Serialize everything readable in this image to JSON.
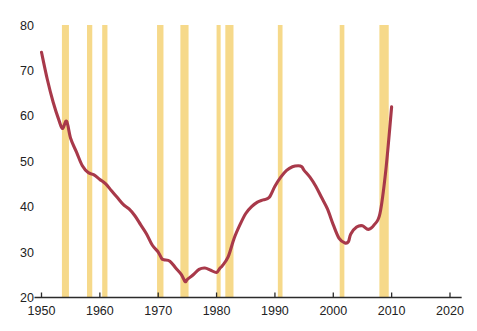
{
  "chart_data": {
    "type": "line",
    "title": "",
    "subtitle": "",
    "xlabel": "",
    "ylabel": "",
    "xlim": [
      1948,
      2022
    ],
    "ylim": [
      20,
      80
    ],
    "grid": false,
    "legend": "none",
    "y_ticks": [
      20,
      30,
      40,
      50,
      60,
      70,
      80
    ],
    "x_ticks": [
      1950,
      1960,
      1970,
      1980,
      1990,
      2000,
      2010,
      2020
    ],
    "series": [
      {
        "name": "series-1",
        "color": "#a8394a",
        "x": [
          1950,
          1951,
          1952,
          1953,
          1953.6,
          1954.3,
          1955,
          1956,
          1957,
          1958,
          1959,
          1960,
          1961,
          1962,
          1963,
          1964,
          1965,
          1966,
          1967,
          1968,
          1969,
          1970,
          1970.6,
          1971,
          1972,
          1973,
          1974,
          1974.6,
          1975,
          1976,
          1977,
          1978,
          1979,
          1980,
          1980.6,
          1981,
          1982,
          1983,
          1984,
          1985,
          1986,
          1987,
          1988,
          1989,
          1990,
          1991,
          1992,
          1993,
          1994,
          1994.6,
          1995,
          1996,
          1997,
          1998,
          1999,
          2000,
          2001,
          2002,
          2002.6,
          2003,
          2004,
          2005,
          2006,
          2007,
          2008,
          2009,
          2010
        ],
        "y": [
          74,
          68,
          63,
          59,
          57.2,
          58.8,
          55,
          52,
          49,
          47.5,
          47,
          46,
          45,
          43.5,
          42,
          40.5,
          39.5,
          38,
          36,
          34,
          31.5,
          30,
          28.6,
          28.3,
          28,
          26.5,
          25,
          23.5,
          24,
          25,
          26.2,
          26.5,
          26,
          25.5,
          26.5,
          27,
          29,
          33,
          36,
          38.5,
          40,
          41,
          41.5,
          42,
          44.5,
          46.5,
          48,
          48.8,
          49,
          48.8,
          48,
          46.5,
          44.5,
          42,
          39.5,
          36,
          33,
          32,
          32.3,
          34,
          35.5,
          35.8,
          35,
          36,
          38.5,
          48,
          62
        ]
      }
    ],
    "recession_bands": [
      {
        "start": 1953.5,
        "end": 1954.7
      },
      {
        "start": 1957.8,
        "end": 1958.7
      },
      {
        "start": 1960.4,
        "end": 1961.3
      },
      {
        "start": 1969.8,
        "end": 1970.9
      },
      {
        "start": 1973.8,
        "end": 1975.2
      },
      {
        "start": 1980.0,
        "end": 1980.7
      },
      {
        "start": 1981.5,
        "end": 1982.9
      },
      {
        "start": 1990.5,
        "end": 1991.3
      },
      {
        "start": 2001.1,
        "end": 2001.9
      },
      {
        "start": 2007.9,
        "end": 2009.5
      }
    ],
    "band_color": "#f6d98a",
    "line_color": "#a8394a",
    "axis_color": "#2b2b2b",
    "background": "#ffffff"
  }
}
